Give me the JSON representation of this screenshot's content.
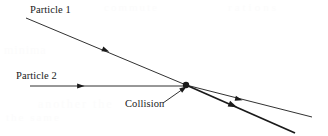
{
  "figure": {
    "background_color": "#ffffff",
    "line_color": "#1a1a1a",
    "width": 328,
    "height": 136
  },
  "labels": {
    "particle_1": "Particle 1",
    "particle_2": "Particle 2",
    "collision": "Collision"
  },
  "ghost_text": {
    "top_a": "commute",
    "top_b": "rations",
    "mid": "minima",
    "low_a": "another the",
    "low_b": "the same"
  },
  "chart_data": {
    "type": "diagram",
    "xlabel": "",
    "ylabel": "",
    "xlim": [
      0,
      328
    ],
    "ylim": [
      0,
      136
    ],
    "grid": false,
    "legend": "none",
    "annotations": [
      {
        "name": "particle-1-label",
        "text": "Particle 1",
        "x": 30,
        "y": 5
      },
      {
        "name": "particle-2-label",
        "text": "Particle 2",
        "x": 16,
        "y": 71
      },
      {
        "name": "collision-label",
        "text": "Collision",
        "x": 125,
        "y": 99
      }
    ],
    "points": [
      {
        "name": "collision-point",
        "x": 186,
        "y": 85,
        "marker": "filled-circle",
        "radius": 3.2
      }
    ],
    "series": [
      {
        "name": "Particle 1 incoming trajectory",
        "style": "thin-line-with-midpoint-arrow",
        "stroke_width": 0.9,
        "arrow_at": {
          "x": 105,
          "y": 50
        },
        "x": [
          26,
          186
        ],
        "y": [
          18,
          85
        ]
      },
      {
        "name": "Particle 2 incoming trajectory",
        "style": "thin-line-with-midpoint-arrow",
        "stroke_width": 0.9,
        "arrow_at": {
          "x": 80,
          "y": 86
        },
        "x": [
          30,
          186
        ],
        "y": [
          86,
          86
        ]
      },
      {
        "name": "Particle 1 outgoing trajectory",
        "style": "thin-line-with-midpoint-arrow",
        "stroke_width": 0.9,
        "arrow_at": {
          "x": 238,
          "y": 99
        },
        "x": [
          186,
          312
        ],
        "y": [
          85,
          117
        ]
      },
      {
        "name": "Particle 2 outgoing trajectory",
        "style": "thick-line-with-midpoint-arrow",
        "stroke_width": 1.8,
        "arrow_at": {
          "x": 232,
          "y": 105
        },
        "x": [
          186,
          295
        ],
        "y": [
          85,
          133
        ]
      },
      {
        "name": "Collision pointer leader line",
        "style": "thin-line-with-end-arrow",
        "stroke_width": 0.9,
        "arrow_at": {
          "x": 183,
          "y": 89
        },
        "x": [
          163,
          183
        ],
        "y": [
          103,
          89
        ]
      }
    ]
  }
}
